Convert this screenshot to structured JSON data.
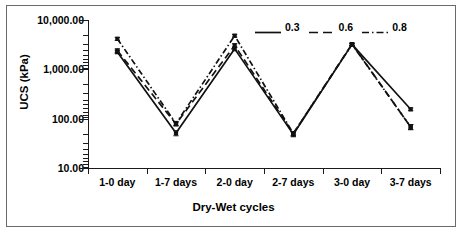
{
  "chart_data": {
    "type": "line",
    "title": "",
    "xlabel": "Dry-Wet cycles",
    "ylabel": "UCS (kPa)",
    "categories": [
      "1-0 day",
      "1-7 days",
      "2-0 day",
      "2-7 days",
      "3-0 day",
      "3-7 days"
    ],
    "yscale": "log",
    "ylim": [
      10,
      10000
    ],
    "ytick_labels": [
      "10,000.00",
      "1,000.00",
      "100.00",
      "10.00"
    ],
    "ytick_values": [
      10000,
      1000,
      100,
      10
    ],
    "grid": false,
    "legend_position": "top-right",
    "series": [
      {
        "name": "0.3",
        "style": "solid",
        "values": [
          2250,
          51,
          2600,
          48,
          3200,
          155
        ],
        "error_bars": [
          180,
          6,
          220,
          5,
          150,
          10
        ]
      },
      {
        "name": "0.6",
        "style": "dashed",
        "values": [
          2400,
          78,
          3050,
          50,
          3250,
          68
        ],
        "error_bars": [
          200,
          7,
          260,
          5,
          160,
          8
        ]
      },
      {
        "name": "0.8",
        "style": "dash-dot",
        "values": [
          4150,
          80,
          4800,
          50,
          3200,
          68
        ],
        "error_bars": [
          300,
          7,
          320,
          5,
          150,
          8
        ]
      }
    ]
  },
  "legend": {
    "items": [
      {
        "label": "0.3",
        "style": "solid"
      },
      {
        "label": "0.6",
        "style": "dashed"
      },
      {
        "label": "0.8",
        "style": "dash-dot"
      }
    ]
  },
  "axes": {
    "y_title": "UCS (kPa)",
    "x_title": "Dry-Wet cycles",
    "y_labels": [
      "10,000.00",
      "1,000.00",
      "100.00",
      "10.00"
    ],
    "x_labels": [
      "1-0 day",
      "1-7 days",
      "2-0 day",
      "2-7 days",
      "3-0 day",
      "3-7 days"
    ]
  },
  "colors": {
    "line": "#111111",
    "axis": "#1a1a1a",
    "frame": "#6a6a6a",
    "background": "#ffffff"
  }
}
